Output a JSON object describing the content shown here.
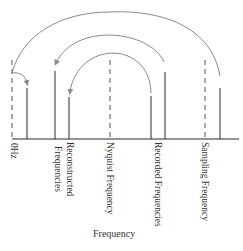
{
  "diagram": {
    "title": "",
    "axis_label": "Frequency",
    "colors": {
      "line": "#2b2b2b",
      "dashed": "#555555",
      "arc": "#8a8a8a",
      "text": "#333333",
      "background": "#ffffff"
    },
    "baseline": {
      "y": 139,
      "x_start": 12,
      "x_end": 239
    },
    "markers": [
      {
        "id": "zero",
        "x": 12,
        "style": "dashed",
        "top": 60,
        "label": "0Hz"
      },
      {
        "id": "recon-low",
        "x": 27,
        "style": "solid",
        "top": 88
      },
      {
        "id": "recon-high",
        "x": 55,
        "style": "solid",
        "top": 71,
        "label": "Reconstructed\nFrequencies",
        "label_lines": [
          "Reconstructed",
          "Frequencies"
        ]
      },
      {
        "id": "recon-mid",
        "x": 69,
        "style": "solid",
        "top": 97
      },
      {
        "id": "nyquist",
        "x": 110,
        "style": "dashed",
        "top": 60,
        "label": "Nyquist Frequency"
      },
      {
        "id": "rec-low",
        "x": 151,
        "style": "solid",
        "top": 96
      },
      {
        "id": "rec-high",
        "x": 165,
        "style": "solid",
        "top": 72,
        "label": "Recorded Frequencies"
      },
      {
        "id": "sampling",
        "x": 205,
        "style": "dashed",
        "top": 60,
        "label": "Sampling Frequency"
      },
      {
        "id": "above-fs",
        "x": 220,
        "style": "solid",
        "top": 88
      }
    ],
    "labels": {
      "zero": "0Hz",
      "reconstructed_line1": "Reconstructed",
      "reconstructed_line2": "Frequencies",
      "nyquist": "Nyquist Frequency",
      "recorded": "Recorded Frequencies",
      "sampling": "Sampling Frequency"
    },
    "arcs": [
      {
        "id": "outer",
        "from_x": 220,
        "to_x": 12,
        "peak_y": 12,
        "description": "Frequency above sampling rate folds to near 0Hz"
      },
      {
        "id": "middle",
        "from_x": 165,
        "to_x": 55,
        "peak_y": 32,
        "description": "Recorded frequency mirrors around Nyquist"
      },
      {
        "id": "inner",
        "from_x": 151,
        "to_x": 69,
        "peak_y": 53,
        "description": "Recorded frequency mirrors around Nyquist"
      },
      {
        "id": "hook",
        "from_x": 12,
        "to_x": 27,
        "description": "Reflection off 0Hz"
      }
    ]
  }
}
